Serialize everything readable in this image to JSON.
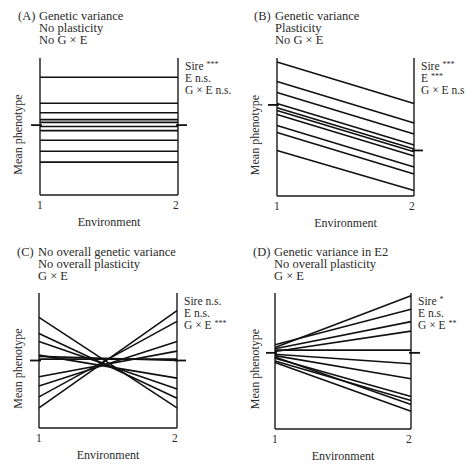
{
  "figure": {
    "panels": [
      {
        "letter": "(A)",
        "title_lines": [
          "Genetic variance",
          "No plasticity",
          "No G × E"
        ],
        "stats": [
          {
            "label": "Sire",
            "sig": "***"
          },
          {
            "label": "E",
            "sig": "n.s."
          },
          {
            "label": "G × E",
            "sig": "n.s."
          }
        ]
      },
      {
        "letter": "(B)",
        "title_lines": [
          "Genetic variance",
          "Plasticity",
          "No G × E"
        ],
        "stats": [
          {
            "label": "Sire",
            "sig": "***"
          },
          {
            "label": "E",
            "sig": "***"
          },
          {
            "label": "G × E",
            "sig": "n.s"
          }
        ]
      },
      {
        "letter": "(C)",
        "title_lines": [
          "No overall genetic variance",
          "No overall plasticity",
          "G × E"
        ],
        "stats": [
          {
            "label": "Sire",
            "sig": "n.s."
          },
          {
            "label": "E",
            "sig": "n.s."
          },
          {
            "label": "G × E",
            "sig": "***"
          }
        ]
      },
      {
        "letter": "(D)",
        "title_lines": [
          "Genetic variance in E2",
          "No overall plasticity",
          "G × E"
        ],
        "stats": [
          {
            "label": "Sire",
            "sig": "*"
          },
          {
            "label": "E",
            "sig": "n.s."
          },
          {
            "label": "G × E",
            "sig": "**"
          }
        ]
      }
    ]
  },
  "chart_data": [
    {
      "type": "line",
      "title": "(A) Genetic variance / No plasticity / No G × E",
      "xlabel": "Environment",
      "ylabel": "Mean phenotype",
      "categories": [
        "1",
        "2"
      ],
      "ylim": [
        0,
        100
      ],
      "grid": false,
      "series": [
        {
          "name": "sire-1",
          "values": [
            86,
            86
          ]
        },
        {
          "name": "sire-2",
          "values": [
            67,
            67
          ]
        },
        {
          "name": "sire-3",
          "values": [
            60,
            60
          ]
        },
        {
          "name": "sire-4",
          "values": [
            55,
            55
          ]
        },
        {
          "name": "sire-5",
          "values": [
            53,
            53
          ]
        },
        {
          "name": "sire-6",
          "values": [
            50,
            50
          ]
        },
        {
          "name": "sire-7",
          "values": [
            47,
            47
          ]
        },
        {
          "name": "sire-8",
          "values": [
            40,
            40
          ]
        },
        {
          "name": "sire-9",
          "values": [
            32,
            32
          ]
        },
        {
          "name": "sire-10",
          "values": [
            24,
            24
          ]
        }
      ],
      "mean": [
        51,
        51
      ],
      "annotations": [
        "Sire ***",
        "E n.s.",
        "G × E n.s."
      ]
    },
    {
      "type": "line",
      "title": "(B) Genetic variance / Plasticity / No G × E",
      "xlabel": "Environment",
      "ylabel": "Mean phenotype",
      "categories": [
        "1",
        "2"
      ],
      "ylim": [
        0,
        100
      ],
      "grid": false,
      "series": [
        {
          "name": "sire-1",
          "values": [
            97,
            67
          ]
        },
        {
          "name": "sire-2",
          "values": [
            83,
            53
          ]
        },
        {
          "name": "sire-3",
          "values": [
            75,
            45
          ]
        },
        {
          "name": "sire-4",
          "values": [
            67,
            37
          ]
        },
        {
          "name": "sire-5",
          "values": [
            64,
            34
          ]
        },
        {
          "name": "sire-6",
          "values": [
            62,
            32
          ]
        },
        {
          "name": "sire-7",
          "values": [
            59,
            29
          ]
        },
        {
          "name": "sire-8",
          "values": [
            51,
            21
          ]
        },
        {
          "name": "sire-9",
          "values": [
            46,
            16
          ]
        },
        {
          "name": "sire-10",
          "values": [
            33,
            4
          ]
        }
      ],
      "mean": [
        66,
        33
      ],
      "annotations": [
        "Sire ***",
        "E ***",
        "G × E n.s"
      ]
    },
    {
      "type": "line",
      "title": "(C) No overall genetic variance / No overall plasticity / G × E",
      "xlabel": "Environment",
      "ylabel": "Mean phenotype",
      "categories": [
        "1",
        "2"
      ],
      "ylim": [
        0,
        100
      ],
      "grid": false,
      "series": [
        {
          "name": "sire-1",
          "values": [
            82,
            15
          ]
        },
        {
          "name": "sire-2",
          "values": [
            70,
            22
          ]
        },
        {
          "name": "sire-3",
          "values": [
            64,
            29
          ]
        },
        {
          "name": "sire-4",
          "values": [
            54,
            37
          ]
        },
        {
          "name": "sire-5",
          "values": [
            53,
            50
          ]
        },
        {
          "name": "sire-6",
          "values": [
            51,
            51
          ]
        },
        {
          "name": "sire-7",
          "values": [
            38,
            57
          ]
        },
        {
          "name": "sire-8",
          "values": [
            31,
            64
          ]
        },
        {
          "name": "sire-9",
          "values": [
            23,
            79
          ]
        },
        {
          "name": "sire-10",
          "values": [
            15,
            87
          ]
        }
      ],
      "mean": [
        50,
        50
      ],
      "annotations": [
        "Sire n.s.",
        "E n.s.",
        "G × E ***"
      ]
    },
    {
      "type": "line",
      "title": "(D) Genetic variance in E2 / No overall plasticity / G × E",
      "xlabel": "Environment",
      "ylabel": "Mean phenotype",
      "categories": [
        "1",
        "2"
      ],
      "ylim": [
        0,
        100
      ],
      "grid": false,
      "series": [
        {
          "name": "sire-1",
          "values": [
            60,
            98
          ]
        },
        {
          "name": "sire-2",
          "values": [
            62,
            88
          ]
        },
        {
          "name": "sire-3",
          "values": [
            59,
            79
          ]
        },
        {
          "name": "sire-4",
          "values": [
            57,
            72
          ]
        },
        {
          "name": "sire-5",
          "values": [
            58,
            58
          ]
        },
        {
          "name": "sire-6",
          "values": [
            55,
            48
          ]
        },
        {
          "name": "sire-7",
          "values": [
            54,
            37
          ]
        },
        {
          "name": "sire-8",
          "values": [
            52,
            24
          ]
        },
        {
          "name": "sire-9",
          "values": [
            50,
            21
          ]
        },
        {
          "name": "sire-10",
          "values": [
            53,
            18
          ]
        },
        {
          "name": "sire-11",
          "values": [
            49,
            13
          ]
        }
      ],
      "mean": [
        56,
        56
      ],
      "annotations": [
        "Sire *",
        "E n.s.",
        "G × E **"
      ]
    }
  ]
}
